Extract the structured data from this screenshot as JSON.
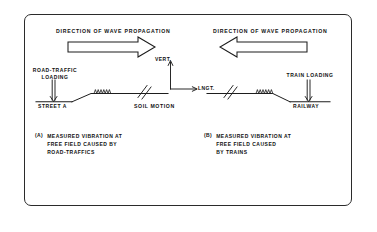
{
  "figure": {
    "frame": {
      "shape": "rounded-rectangle",
      "stroke_color": "#2b2b2b"
    },
    "panels": [
      {
        "id": "a",
        "heading": "DIRECTION OF WAVE PROPAGATION",
        "arrow_direction": "right",
        "source_label": "ROAD-TRAFFIC\nLOADING",
        "source_arrow_direction": "down",
        "ground_label": "STREET A",
        "caption_marker": "(a)",
        "caption": "MEASURED VIBRATION AT\nFREE FIELD CAUSED BY\nROAD-TRAFFICS"
      },
      {
        "id": "b",
        "heading": "DIRECTION OF WAVE PROPAGATION",
        "arrow_direction": "left",
        "source_label": "TRAIN LOADING",
        "source_arrow_direction": "down",
        "ground_label": "RAILWAY",
        "caption_marker": "(b)",
        "caption": "MEASURED VIBRATION AT\nFREE FIELD CAUSED\nBY TRAINS"
      }
    ],
    "center": {
      "soil_motion_label": "SOIL MOTION",
      "axis_vertical_label": "VERT.",
      "axis_longitudinal_label": "LNGT."
    },
    "colors": {
      "ink": "#111111",
      "line": "#2b2b2b",
      "background": "#ffffff"
    }
  }
}
